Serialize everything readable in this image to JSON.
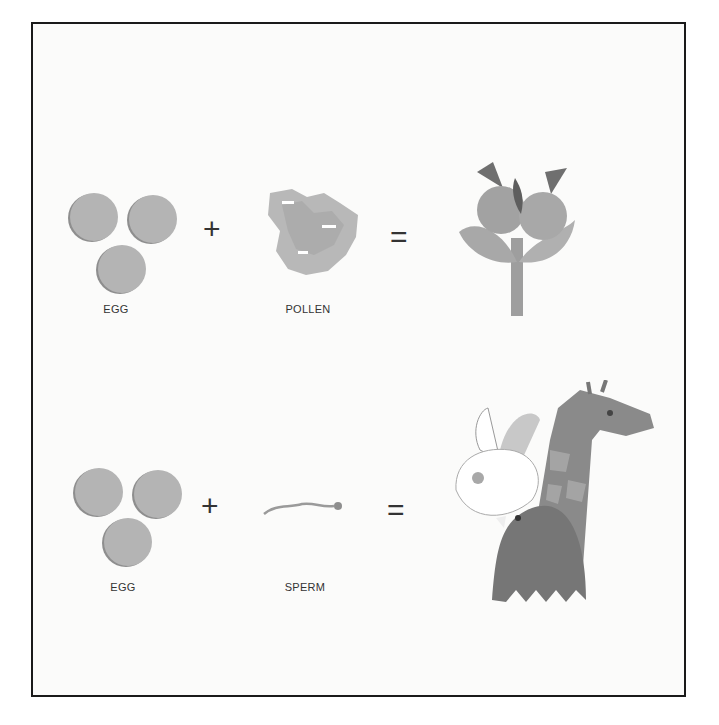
{
  "rows": [
    {
      "left_label": "EGG",
      "middle_label": "POLLEN",
      "plus": "+",
      "equals": "=",
      "result": "flower"
    },
    {
      "left_label": "EGG",
      "middle_label": "SPERM",
      "plus": "+",
      "equals": "=",
      "result": "animals (rabbit, giraffe, bird)"
    }
  ],
  "colors": {
    "border": "#1a1a1a",
    "background": "#fbfbfa",
    "egg": "#b4b4b4",
    "text": "#333333"
  }
}
